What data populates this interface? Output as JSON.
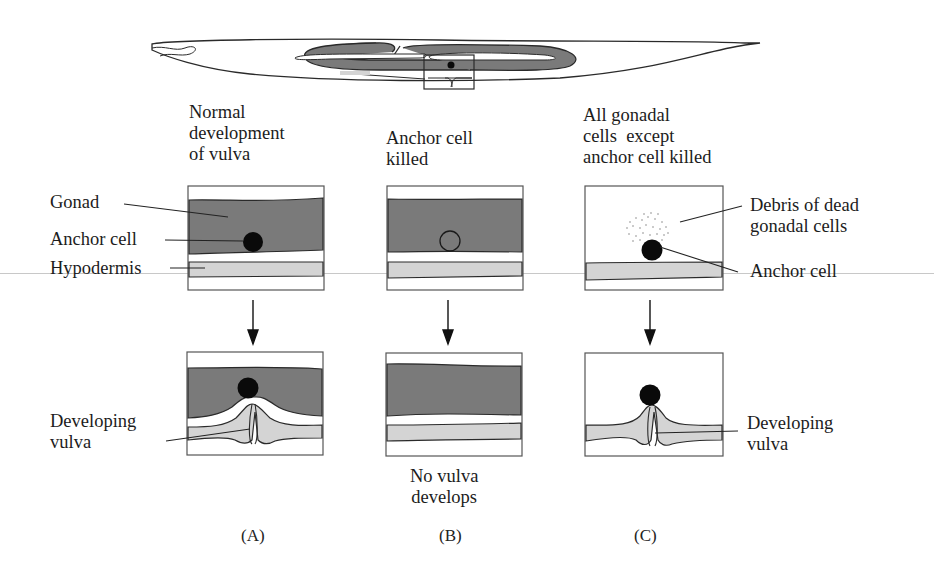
{
  "figure": {
    "overview": {
      "description": "C. elegans worm outline with gonad arms and boxed vulva region"
    },
    "columns": [
      {
        "id": "A",
        "title": "Normal\ndevelopment\nof vulva",
        "top_labels": [
          "Gonad",
          "Anchor cell",
          "Hypodermis"
        ],
        "bottom_label": "Developing\nvulva",
        "panel_label": "(A)"
      },
      {
        "id": "B",
        "title": "Anchor cell\nkilled",
        "outcome": "No vulva\ndevelops",
        "panel_label": "(B)"
      },
      {
        "id": "C",
        "title": "All gonadal\ncells  except\nanchor cell killed",
        "top_labels": [
          "Debris of dead\ngonadal cells",
          "Anchor cell"
        ],
        "bottom_label": "Developing\nvulva",
        "panel_label": "(C)"
      }
    ],
    "colors": {
      "gonad": "#7a7a7a",
      "hypodermis": "#d4d4d4",
      "outline": "#2a2a2a",
      "anchor_cell": "#0a0a0a",
      "background": "#ffffff"
    }
  }
}
